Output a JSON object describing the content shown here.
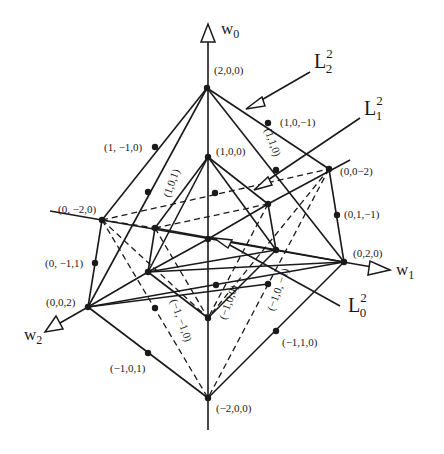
{
  "figure": {
    "type": "diagram",
    "colors": {
      "stroke": "#1a1a1a",
      "background": "#ffffff"
    }
  },
  "axes": {
    "w0": {
      "base": "w",
      "sub": "0"
    },
    "w1": {
      "base": "w",
      "sub": "1"
    },
    "w2": {
      "base": "w",
      "sub": "2"
    }
  },
  "level_sets": {
    "L2": {
      "base": "L",
      "sup": "2",
      "sub": "2"
    },
    "L1": {
      "base": "L",
      "sup": "2",
      "sub": "1"
    },
    "L0": {
      "base": "L",
      "sup": "2",
      "sub": "0"
    }
  },
  "points": {
    "p200": "(2,0,0)",
    "p10m1": "(1,0,−1)",
    "p110": "(1,1,0)",
    "p00m2": "(0,0−2)",
    "p01m1": "(0,1,−1)",
    "p020": "(0,2,0)",
    "p1m10": "(1, −1,0)",
    "p101": "(1,0,1)",
    "p100": "(1,0,0)",
    "p0m20": "(0, −2,0)",
    "p0m11": "(0, −1,1)",
    "p002": "(0,0,2)",
    "pm1m10": "(−1, −1,0)",
    "pm100": "(−1,0,0)",
    "pm10m1": "(−1,0, −1)",
    "pm110": "(−1,1,0)",
    "pm101": "(−1,0,1)",
    "pm200": "(−2,0,0)"
  }
}
